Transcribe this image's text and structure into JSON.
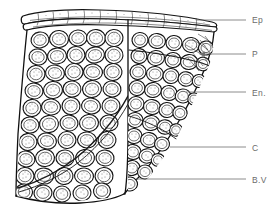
{
  "figure": {
    "type": "line-drawing",
    "background_color": "#ffffff",
    "ink_color": "#141414",
    "label_color": "#6b6b6b",
    "width": 280,
    "height": 209
  },
  "labels": [
    {
      "id": "ep",
      "text": "Ep",
      "full_name": "Epidermis",
      "x": 252,
      "y": 23,
      "leader": {
        "x1": 196,
        "y1": 20,
        "x2": 246,
        "y2": 20,
        "arrow": false
      }
    },
    {
      "id": "p",
      "text": "P",
      "full_name": "Parenchyma",
      "x": 252,
      "y": 57,
      "leader": {
        "x1": 200,
        "y1": 54,
        "x2": 246,
        "y2": 54,
        "arrow": true
      }
    },
    {
      "id": "en",
      "text": "En.",
      "full_name": "Endodermis",
      "x": 252,
      "y": 96,
      "leader": {
        "x1": 186,
        "y1": 92,
        "x2": 246,
        "y2": 92,
        "arrow": false
      }
    },
    {
      "id": "c",
      "text": "C",
      "full_name": "Cortex",
      "x": 252,
      "y": 151,
      "leader": {
        "x1": 170,
        "y1": 147,
        "x2": 246,
        "y2": 147,
        "arrow": false
      }
    },
    {
      "id": "bv",
      "text": "B.V",
      "full_name": "Blood Vessel",
      "x": 252,
      "y": 183,
      "leader": {
        "x1": 136,
        "y1": 179,
        "x2": 246,
        "y2": 179,
        "arrow": false
      }
    }
  ],
  "specimen": {
    "name": "tissue-block",
    "left_edge_top_x": 27,
    "left_edge_bottom_x": 16,
    "top_y": 12,
    "bottom_y": 203,
    "epidermis_band_height": 11,
    "divider_x": 128,
    "cell_fill": "#ffffff",
    "cell_stroke": "#141414",
    "stipple_color": "#3a3a3a",
    "regions": [
      {
        "id": "epidermis",
        "label_ref": "ep",
        "description": "flattened surface band of elongated cells"
      },
      {
        "id": "parenchyma",
        "label_ref": "p",
        "description": "upper rounded stippled cells"
      },
      {
        "id": "endodermis",
        "label_ref": "en",
        "description": "inner boundary layer"
      },
      {
        "id": "cortex",
        "label_ref": "c",
        "description": "bulk of packed rounded stippled cells"
      },
      {
        "id": "blood-vessel",
        "label_ref": "bv",
        "description": "lower right cut margin"
      }
    ]
  }
}
